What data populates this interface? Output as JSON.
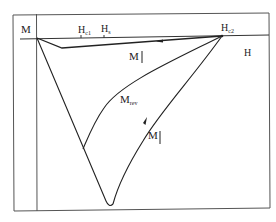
{
  "diagram": {
    "type": "magnetization-hysteresis",
    "axes": {
      "y_label": "M",
      "x_label": "H"
    },
    "tick_labels": {
      "hc1": {
        "base": "H",
        "sub": "c1"
      },
      "hs": {
        "base": "H",
        "sub": "s"
      },
      "hc2": {
        "base": "H",
        "sub": "c2"
      }
    },
    "curve_labels": {
      "m_down": {
        "base": "M",
        "arrow": "↓"
      },
      "m_rev": {
        "base": "M",
        "sub": "rev"
      },
      "m_up": {
        "base": "M",
        "arrow": "↑"
      }
    },
    "colors": {
      "line": "#333333",
      "frame": "#555555",
      "text": "#222222"
    }
  }
}
